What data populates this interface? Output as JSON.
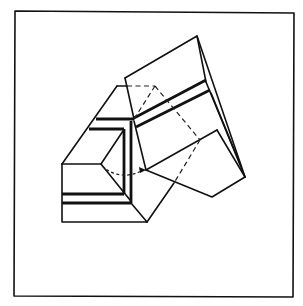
{
  "figure": {
    "line_color": "#111111",
    "background": "#ffffff",
    "elements": [
      {
        "name": "frame",
        "type": "rectangle-border"
      },
      {
        "name": "left-block",
        "type": "prism",
        "stripes": 2
      },
      {
        "name": "upper-left-block",
        "type": "prism",
        "stripes": 2
      },
      {
        "name": "right-block",
        "type": "tilted-prism",
        "stripes": 2
      },
      {
        "name": "dashed-construction-lines",
        "type": "dashed"
      },
      {
        "name": "rotation-arrow",
        "type": "curved-dashed-arrow"
      }
    ]
  }
}
